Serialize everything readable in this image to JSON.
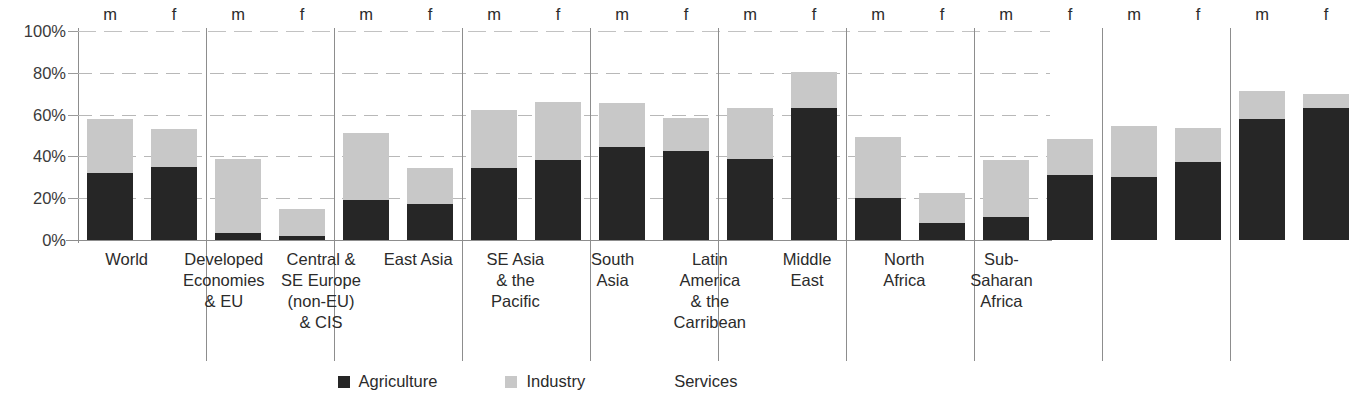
{
  "chart_data": {
    "type": "bar",
    "subtype": "stacked-grouped",
    "title": "",
    "xlabel": "",
    "ylabel": "",
    "ylim": [
      0,
      100
    ],
    "y_unit": "%",
    "grid": true,
    "legend_position": "bottom",
    "y_ticks": [
      "0%",
      "20%",
      "40%",
      "60%",
      "80%",
      "100%"
    ],
    "y_tick_values": [
      0,
      20,
      40,
      60,
      80,
      100
    ],
    "series": [
      {
        "name": "Agriculture",
        "color": "#262626"
      },
      {
        "name": "Industry",
        "color": "#c8c8c8"
      },
      {
        "name": "Services",
        "color": "#ffffff"
      }
    ],
    "sex_labels": [
      "m",
      "f"
    ],
    "categories": [
      "World",
      "Developed Economies & EU",
      "Central & SE Europe (non-EU) & CIS",
      "East Asia",
      "SE Asia & the Pacific",
      "South Asia",
      "Latin America & the Carribean",
      "Middle East",
      "North Africa",
      "Sub-Saharan Africa"
    ],
    "category_label_lines": [
      [
        "World"
      ],
      [
        "Developed",
        "Economies",
        "& EU"
      ],
      [
        "Central &",
        "SE Europe",
        "(non-EU)",
        "& CIS"
      ],
      [
        "East Asia"
      ],
      [
        "SE Asia",
        "& the",
        "Pacific"
      ],
      [
        "South",
        "Asia"
      ],
      [
        "Latin",
        "America",
        "& the",
        "Carribean"
      ],
      [
        "Middle",
        "East"
      ],
      [
        "North",
        "Africa"
      ],
      [
        "Sub-",
        "Saharan",
        "Africa"
      ]
    ],
    "groups": [
      {
        "category": "World",
        "bars": [
          {
            "sex": "m",
            "agriculture": 32,
            "industry": 26,
            "total": 58
          },
          {
            "sex": "f",
            "agriculture": 35,
            "industry": 18,
            "total": 53
          }
        ]
      },
      {
        "category": "Developed Economies & EU",
        "bars": [
          {
            "sex": "m",
            "agriculture": 3.5,
            "industry": 35.5,
            "total": 39
          },
          {
            "sex": "f",
            "agriculture": 2,
            "industry": 13,
            "total": 15
          }
        ]
      },
      {
        "category": "Central & SE Europe (non-EU) & CIS",
        "bars": [
          {
            "sex": "m",
            "agriculture": 19,
            "industry": 32,
            "total": 51
          },
          {
            "sex": "f",
            "agriculture": 17,
            "industry": 17.5,
            "total": 34.5
          }
        ]
      },
      {
        "category": "East Asia",
        "bars": [
          {
            "sex": "m",
            "agriculture": 34.5,
            "industry": 27.5,
            "total": 62
          },
          {
            "sex": "f",
            "agriculture": 38.5,
            "industry": 27.5,
            "total": 66
          }
        ]
      },
      {
        "category": "SE Asia & the Pacific",
        "bars": [
          {
            "sex": "m",
            "agriculture": 44.5,
            "industry": 21,
            "total": 65.5
          },
          {
            "sex": "f",
            "agriculture": 42.5,
            "industry": 16,
            "total": 58.5
          }
        ]
      },
      {
        "category": "South Asia",
        "bars": [
          {
            "sex": "m",
            "agriculture": 39,
            "industry": 24,
            "total": 63
          },
          {
            "sex": "f",
            "agriculture": 63,
            "industry": 17.5,
            "total": 80.5
          }
        ]
      },
      {
        "category": "Latin America & the Carribean",
        "bars": [
          {
            "sex": "m",
            "agriculture": 20,
            "industry": 29.5,
            "total": 49.5
          },
          {
            "sex": "f",
            "agriculture": 8,
            "industry": 14.5,
            "total": 22.5
          }
        ]
      },
      {
        "category": "Middle East",
        "bars": [
          {
            "sex": "m",
            "agriculture": 11,
            "industry": 27.5,
            "total": 38.5
          },
          {
            "sex": "f",
            "agriculture": 31,
            "industry": 17.5,
            "total": 48.5
          }
        ]
      },
      {
        "category": "North Africa",
        "bars": [
          {
            "sex": "m",
            "agriculture": 30,
            "industry": 24.5,
            "total": 54.5
          },
          {
            "sex": "f",
            "agriculture": 37.5,
            "industry": 16,
            "total": 53.5
          }
        ]
      },
      {
        "category": "Sub-Saharan Africa",
        "bars": [
          {
            "sex": "m",
            "agriculture": 58,
            "industry": 13.5,
            "total": 71.5
          },
          {
            "sex": "f",
            "agriculture": 63,
            "industry": 7,
            "total": 70
          }
        ]
      }
    ]
  },
  "legend": {
    "items": [
      {
        "label": "Agriculture",
        "color": "#262626",
        "has_swatch": true
      },
      {
        "label": "Industry",
        "color": "#c8c8c8",
        "has_swatch": true
      },
      {
        "label": "Services",
        "color": "#ffffff",
        "has_swatch": false
      }
    ]
  },
  "colors": {
    "agriculture": "#262626",
    "industry": "#c8c8c8",
    "services": "#ffffff",
    "axis": "#8d8d8d",
    "grid": "#b8b8b8",
    "text": "#2b2b2b"
  }
}
